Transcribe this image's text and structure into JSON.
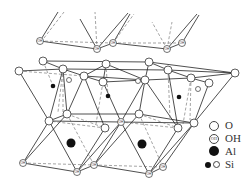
{
  "figure": {
    "colors": {
      "line": "#222222",
      "dash": "#555555",
      "atom_fill": "#ffffff",
      "cation": "#111111"
    }
  },
  "legend": {
    "items": [
      {
        "symbol": "open-circle",
        "label": "O"
      },
      {
        "symbol": "hydroxyl-circle",
        "label": "OH"
      },
      {
        "symbol": "filled-circle-large",
        "label": "Al"
      },
      {
        "symbol": "filled-and-open-small-circles",
        "label": "Si"
      }
    ]
  },
  "atoms": {
    "oh_label": "OH",
    "oh_top": [
      [
        40,
        41
      ],
      [
        97,
        49
      ],
      [
        113,
        43
      ],
      [
        167,
        49
      ],
      [
        182,
        43
      ]
    ],
    "oh_mid": [
      [
        121,
        122
      ]
    ],
    "oh_bottom": [
      [
        23,
        163
      ],
      [
        77,
        172
      ],
      [
        94,
        165
      ],
      [
        149,
        174
      ],
      [
        163,
        167
      ]
    ],
    "o_top": [
      [
        43,
        61
      ],
      [
        19,
        71
      ],
      [
        63,
        69
      ],
      [
        106,
        64
      ],
      [
        149,
        62
      ],
      [
        168,
        70
      ],
      [
        235,
        73
      ],
      [
        84,
        76
      ],
      [
        103,
        82
      ],
      [
        145,
        80
      ],
      [
        191,
        78
      ],
      [
        209,
        83
      ]
    ],
    "o_mid": [
      [
        49,
        121
      ],
      [
        67,
        114
      ],
      [
        105,
        128
      ],
      [
        139,
        114
      ],
      [
        178,
        128
      ],
      [
        194,
        123
      ]
    ],
    "si_black": [
      [
        53,
        86
      ],
      [
        108,
        96
      ],
      [
        179,
        97
      ]
    ],
    "si_open": [
      [
        69,
        80
      ],
      [
        198,
        89
      ],
      [
        138,
        81
      ]
    ],
    "al": [
      [
        71,
        143
      ],
      [
        142,
        144
      ]
    ]
  }
}
